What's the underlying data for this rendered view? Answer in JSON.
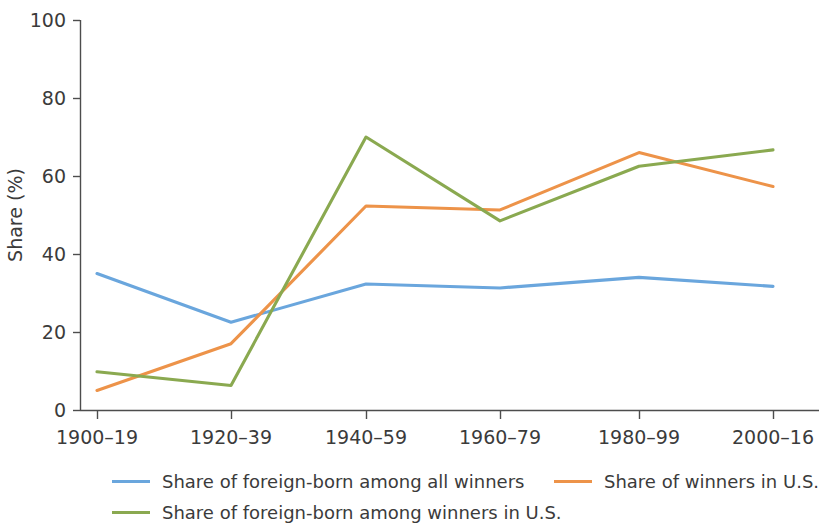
{
  "chart_data": {
    "type": "line",
    "title": "",
    "xlabel": "",
    "ylabel": "Share (%)",
    "categories": [
      "1900–19",
      "1920–39",
      "1940–59",
      "1960–79",
      "1980–99",
      "2000–16"
    ],
    "ylim": [
      0,
      100
    ],
    "yticks": [
      0,
      20,
      40,
      60,
      80,
      100
    ],
    "ytick_labels": [
      "0",
      "20",
      "40",
      "60",
      "80",
      "100"
    ],
    "grid": false,
    "legend_position": "below",
    "series": [
      {
        "name": "Share of foreign-born among all winners",
        "color": "#6aa6dd",
        "values": [
          35,
          22.5,
          32.3,
          31.3,
          34,
          31.7
        ]
      },
      {
        "name": "Share of winners in U.S.",
        "color": "#ed9349",
        "values": [
          5,
          17,
          52.3,
          51.3,
          66,
          57.3
        ]
      },
      {
        "name": "Share of foreign-born among winners in U.S.",
        "color": "#8aa950",
        "values": [
          9.8,
          6.3,
          70,
          48.5,
          62.5,
          66.7
        ]
      }
    ]
  },
  "legend": {
    "entries": [
      {
        "label": "Share of foreign-born among all winners",
        "color": "#6aa6dd"
      },
      {
        "label": "Share of winners in U.S.",
        "color": "#ed9349"
      },
      {
        "label": "Share of foreign-born among winners in U.S.",
        "color": "#8aa950"
      }
    ]
  },
  "axes": {
    "y_title": "Share (%)",
    "y_tick_0": "0",
    "y_tick_1": "20",
    "y_tick_2": "40",
    "y_tick_3": "60",
    "y_tick_4": "80",
    "y_tick_5": "100",
    "x_tick_0": "1900–19",
    "x_tick_1": "1920–39",
    "x_tick_2": "1940–59",
    "x_tick_3": "1960–79",
    "x_tick_4": "1980–99",
    "x_tick_5": "2000–16"
  }
}
